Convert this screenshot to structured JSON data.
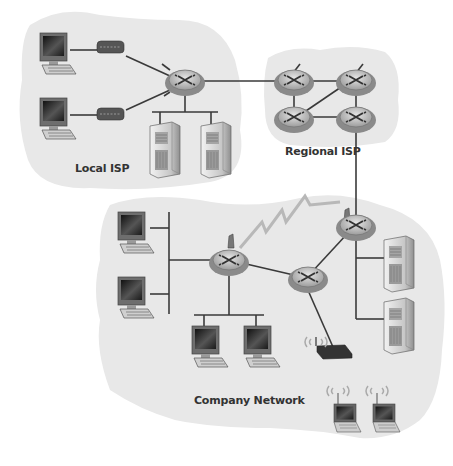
{
  "diagram": {
    "type": "network-topology",
    "regions": [
      {
        "id": "local-isp",
        "label": "Local ISP"
      },
      {
        "id": "regional-isp",
        "label": "Regional ISP"
      },
      {
        "id": "company-network",
        "label": "Company Network"
      }
    ],
    "nodes": {
      "local_isp": {
        "hosts": 2,
        "modems": 2,
        "routers": 1,
        "servers": 2
      },
      "regional_isp": {
        "routers": 4
      },
      "company_network": {
        "routers": 3,
        "desktop_hosts": 4,
        "servers": 2,
        "wireless_access_points": 1,
        "wireless_laptops": 2
      }
    },
    "links": [
      {
        "from": "local-isp-router",
        "to": "regional-isp-router-1",
        "type": "wired"
      },
      {
        "from": "regional-isp-router-4",
        "to": "company-router-edge",
        "type": "wired"
      },
      {
        "from": "company-router-left",
        "to": "company-router-edge",
        "type": "wireless"
      },
      {
        "from": "company-router-left",
        "to": "company-router-mid",
        "type": "wired"
      },
      {
        "from": "company-router-mid",
        "to": "company-router-edge",
        "type": "wired"
      },
      {
        "from": "company-router-mid",
        "to": "wireless-ap",
        "type": "wired"
      }
    ],
    "colors": {
      "cloud": "#e8e8e8",
      "line": "#3a3a3a",
      "router_top": "#c9c9c9",
      "router_ring": "#8a8a8a",
      "wireless_bolt": "#b8b8b8"
    }
  }
}
